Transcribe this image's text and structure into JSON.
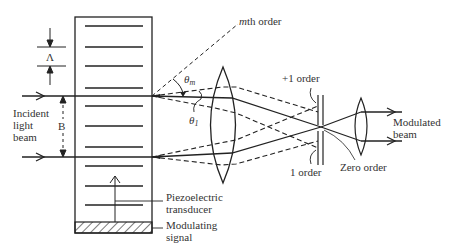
{
  "figure": {
    "labels": {
      "lambda": "Λ",
      "b": "B",
      "incident_line1": "Incident",
      "incident_line2": "light",
      "incident_line3": "beam",
      "mth_order_m": "m",
      "mth_order_rest": "th order",
      "theta_m": "θ",
      "theta_m_sub": "m",
      "theta_1": "θ",
      "theta_1_sub": "1",
      "plus1_order": "+1 order",
      "minus1_order": "1 order",
      "zero_order": "Zero order",
      "modulated_line1": "Modulated",
      "modulated_line2": "beam",
      "piezo_line1": "Piezoelectric",
      "piezo_line2": "transducer",
      "signal_line1": "Modulating",
      "signal_line2": "signal"
    },
    "colors": {
      "ink": "#222222",
      "text": "#333333",
      "background": "#ffffff"
    }
  }
}
